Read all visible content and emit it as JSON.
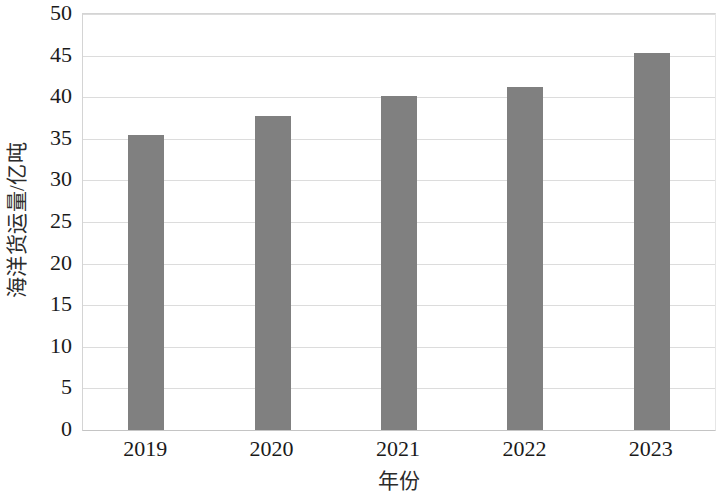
{
  "chart_data": {
    "type": "bar",
    "title": "",
    "subtitle": "",
    "xlabel": "年份",
    "ylabel": "海洋货运量/亿吨",
    "categories": [
      "2019",
      "2020",
      "2021",
      "2022",
      "2023"
    ],
    "values": [
      35.4,
      37.8,
      40.1,
      41.2,
      45.3
    ],
    "series": [
      {
        "name": "海洋货运量",
        "values": [
          35.4,
          37.8,
          40.1,
          41.2,
          45.3
        ]
      }
    ],
    "ylim": [
      0,
      50
    ],
    "y_ticks": [
      0,
      5,
      10,
      15,
      20,
      25,
      30,
      35,
      40,
      45,
      50
    ],
    "y_tick_labels": [
      "0",
      "5",
      "10",
      "15",
      "20",
      "25",
      "30",
      "35",
      "40",
      "45",
      "50"
    ],
    "grid": true,
    "grid_axis": "y",
    "legend": false,
    "legend_position": "none",
    "bar_color": "#808080",
    "gridline_color": "#dcdcdc",
    "plot_border_color": "#d4d4d4",
    "background_color": "#ffffff",
    "annotations": []
  }
}
